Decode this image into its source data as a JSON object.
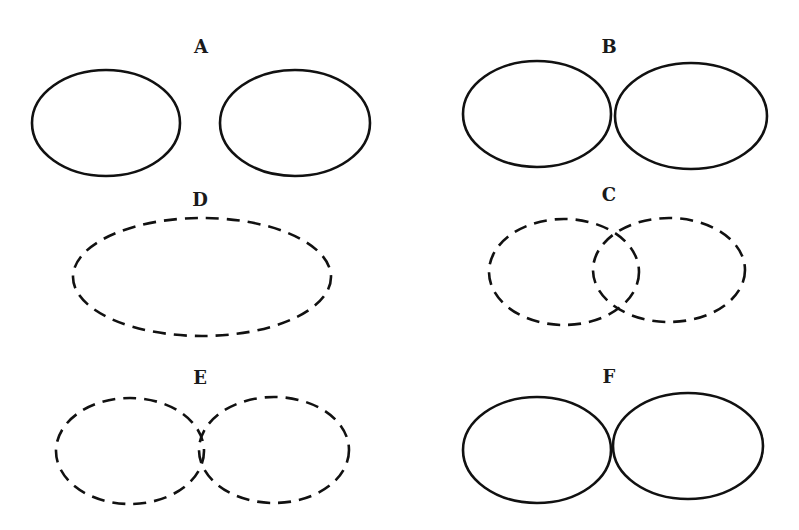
{
  "figure": {
    "stroke_color": "#111111",
    "background": "#ffffff",
    "panels": [
      {
        "label": "A",
        "label_pos": [
          201,
          47
        ],
        "ellipses": [
          {
            "cx": 106,
            "cy": 123,
            "rx": 74,
            "ry": 53,
            "style": "solid"
          },
          {
            "cx": 295,
            "cy": 123,
            "rx": 75,
            "ry": 53,
            "style": "solid"
          }
        ],
        "relation": "separate"
      },
      {
        "label": "B",
        "label_pos": [
          609,
          47
        ],
        "ellipses": [
          {
            "cx": 537,
            "cy": 114,
            "rx": 74,
            "ry": 53,
            "style": "solid"
          },
          {
            "cx": 691,
            "cy": 116,
            "rx": 76,
            "ry": 53,
            "style": "solid"
          }
        ],
        "relation": "touching"
      },
      {
        "label": "D",
        "label_pos": [
          200,
          200
        ],
        "ellipses": [
          {
            "cx": 202,
            "cy": 277,
            "rx": 129,
            "ry": 59,
            "style": "dashed"
          }
        ],
        "relation": "single"
      },
      {
        "label": "C",
        "label_pos": [
          609,
          195
        ],
        "ellipses": [
          {
            "cx": 564,
            "cy": 272,
            "rx": 75,
            "ry": 53,
            "style": "dashed"
          },
          {
            "cx": 669,
            "cy": 270,
            "rx": 76,
            "ry": 52,
            "style": "dashed"
          }
        ],
        "relation": "overlapping"
      },
      {
        "label": "E",
        "label_pos": [
          200,
          378
        ],
        "ellipses": [
          {
            "cx": 130,
            "cy": 451,
            "rx": 74,
            "ry": 53,
            "style": "dashed"
          },
          {
            "cx": 274,
            "cy": 450,
            "rx": 75,
            "ry": 53,
            "style": "dashed"
          }
        ],
        "relation": "slightly-overlapping"
      },
      {
        "label": "F",
        "label_pos": [
          609,
          377
        ],
        "ellipses": [
          {
            "cx": 537,
            "cy": 450,
            "rx": 74,
            "ry": 53,
            "style": "solid"
          },
          {
            "cx": 688,
            "cy": 446,
            "rx": 75,
            "ry": 53,
            "style": "solid"
          }
        ],
        "relation": "touching"
      }
    ]
  }
}
